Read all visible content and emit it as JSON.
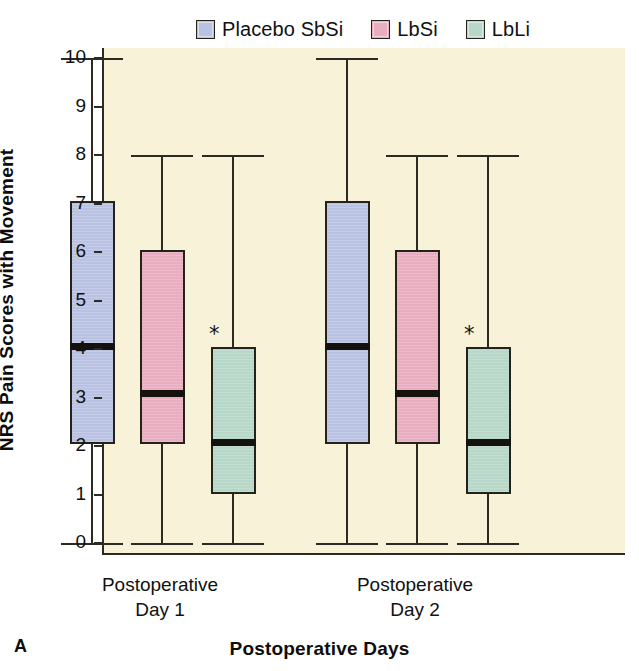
{
  "panel_letter": "A",
  "legend": {
    "items": [
      {
        "label": "Placebo SbSi",
        "color": "#b9c2e2",
        "key": "placebo"
      },
      {
        "label": "LbSi",
        "color": "#e9adc0",
        "key": "lbsi"
      },
      {
        "label": "LbLi",
        "color": "#b7d7c8",
        "key": "lbli"
      }
    ]
  },
  "chart_data": {
    "type": "box",
    "title": "",
    "subtitle": "",
    "xlabel": "Postoperative Days",
    "ylabel": "NRS Pain Scores with Movement",
    "ylim": [
      0,
      10
    ],
    "yticks": [
      0,
      1,
      2,
      3,
      4,
      5,
      6,
      7,
      8,
      9,
      10
    ],
    "ytick_labels": [
      "0",
      "1",
      "2",
      "3",
      "4",
      "5",
      "6",
      "7",
      "8",
      "9",
      "10"
    ],
    "grid": false,
    "legend_position": "top-center",
    "categories": [
      "Postoperative Day 1",
      "Postoperative Day 2"
    ],
    "category_lines": [
      [
        "Postoperative",
        "Day 1"
      ],
      [
        "Postoperative",
        "Day 2"
      ]
    ],
    "series": [
      {
        "name": "Placebo SbSi",
        "color": "#b9c2e2",
        "boxes": [
          {
            "category": "Postoperative Day 1",
            "whisker_low": 0,
            "q1": 2.05,
            "median": 4.05,
            "q3": 7.05,
            "whisker_high": 10,
            "annotation": ""
          },
          {
            "category": "Postoperative Day 2",
            "whisker_low": 0,
            "q1": 2.05,
            "median": 4.05,
            "q3": 7.05,
            "whisker_high": 10,
            "annotation": ""
          }
        ]
      },
      {
        "name": "LbSi",
        "color": "#e9adc0",
        "boxes": [
          {
            "category": "Postoperative Day 1",
            "whisker_low": 0,
            "q1": 2.05,
            "median": 3.08,
            "q3": 6.05,
            "whisker_high": 8,
            "annotation": ""
          },
          {
            "category": "Postoperative Day 2",
            "whisker_low": 0,
            "q1": 2.05,
            "median": 3.08,
            "q3": 6.05,
            "whisker_high": 8,
            "annotation": ""
          }
        ]
      },
      {
        "name": "LbLi",
        "color": "#b7d7c8",
        "boxes": [
          {
            "category": "Postoperative Day 1",
            "whisker_low": 0,
            "q1": 1.02,
            "median": 2.08,
            "q3": 4.05,
            "whisker_high": 8,
            "annotation": "*"
          },
          {
            "category": "Postoperative Day 2",
            "whisker_low": 0,
            "q1": 1.02,
            "median": 2.08,
            "q3": 4.05,
            "whisker_high": 8,
            "annotation": "*"
          }
        ]
      }
    ],
    "annotations": [
      {
        "text": "*",
        "series": "LbLi",
        "category": "Postoperative Day 1",
        "value": 4.4
      },
      {
        "text": "*",
        "series": "LbLi",
        "category": "Postoperative Day 2",
        "value": 4.4
      }
    ]
  },
  "colors": {
    "plot_background": "#f7f2d8",
    "page_background": "#ffffff",
    "axis": "#2b2b24",
    "text": "#111111",
    "median_line": "#15120d"
  }
}
